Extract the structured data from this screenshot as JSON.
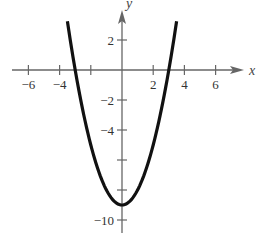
{
  "chart_data": {
    "type": "line",
    "title": "",
    "xlabel": "x",
    "ylabel": "y",
    "xlim": [
      -7.5,
      8
    ],
    "ylim": [
      -11,
      4.5
    ],
    "x_ticks": [
      -6,
      -4,
      -2,
      2,
      4,
      6
    ],
    "x_tick_labels": [
      "−6",
      "−4",
      "",
      "2",
      "4",
      "6"
    ],
    "y_ticks": [
      2,
      -2,
      -4,
      -6,
      -8,
      -10
    ],
    "y_tick_labels": [
      "2",
      "−2",
      "−4",
      "",
      "",
      "−10"
    ],
    "grid": false,
    "series": [
      {
        "name": "y = x^2 - 9",
        "function": "x^2 - 9",
        "x_domain": [
          -3.5,
          3.5
        ],
        "points": [
          {
            "x": -3.5,
            "y": 3.25
          },
          {
            "x": -3,
            "y": 0
          },
          {
            "x": -2,
            "y": -5
          },
          {
            "x": -1,
            "y": -8
          },
          {
            "x": 0,
            "y": -9
          },
          {
            "x": 1,
            "y": -8
          },
          {
            "x": 2,
            "y": -5
          },
          {
            "x": 3,
            "y": 0
          },
          {
            "x": 3.5,
            "y": 3.25
          }
        ],
        "color": "#111111"
      }
    ],
    "axis_color": "#666666"
  }
}
